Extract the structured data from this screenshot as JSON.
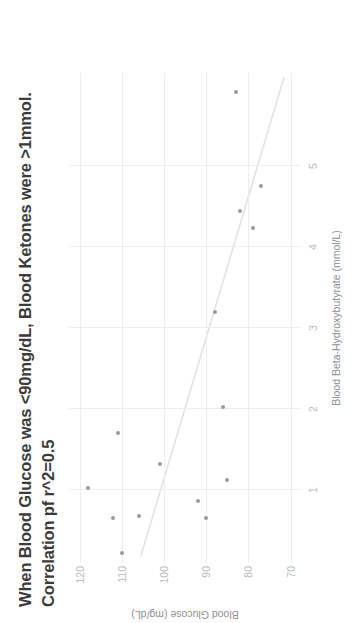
{
  "chart_data": {
    "type": "scatter",
    "title": "When Blood Glucose was <90mg/dL, Blood Ketones were >1mmol.",
    "subtitle": "Correlation pf r^2=0.5",
    "xlabel": "Blood Beta-Hydroxybutyrate (mmol/L)",
    "ylabel": "Blood Glucose (mg/dL)",
    "xlim": [
      0.1,
      6.15
    ],
    "ylim": [
      67.5,
      122.5
    ],
    "xticks": [
      1,
      2,
      3,
      4,
      5
    ],
    "xticklabels": [
      "1",
      "2",
      "3",
      "4",
      "5"
    ],
    "yticks": [
      120,
      110,
      100,
      90,
      80,
      70
    ],
    "yticklabels": [
      "120",
      "110",
      "100",
      "90",
      "80",
      "70"
    ],
    "grid": true,
    "legend": false,
    "marker_color": "#9a9aa2",
    "trendline_color": "#e2e2e6",
    "grid_color": "#ededf0",
    "tick_color": "#b9b9c0",
    "axis_label_color": "#8e8e96",
    "title_color": "#3b3b3b",
    "points": [
      {
        "x": 0.22,
        "y": 110
      },
      {
        "x": 0.65,
        "y": 112
      },
      {
        "x": 0.68,
        "y": 106
      },
      {
        "x": 0.66,
        "y": 90
      },
      {
        "x": 0.86,
        "y": 92
      },
      {
        "x": 1.02,
        "y": 118
      },
      {
        "x": 1.12,
        "y": 85
      },
      {
        "x": 1.32,
        "y": 101
      },
      {
        "x": 1.7,
        "y": 111
      },
      {
        "x": 2.02,
        "y": 86
      },
      {
        "x": 3.2,
        "y": 88
      },
      {
        "x": 4.24,
        "y": 79
      },
      {
        "x": 4.45,
        "y": 82
      },
      {
        "x": 4.76,
        "y": 77
      },
      {
        "x": 5.92,
        "y": 83
      }
    ],
    "trendline": {
      "description": "linear fit, negative slope in glucose vs BHB",
      "x_start": 0.18,
      "y_start": 105.5,
      "x_end": 6.1,
      "y_end": 71.5
    }
  }
}
